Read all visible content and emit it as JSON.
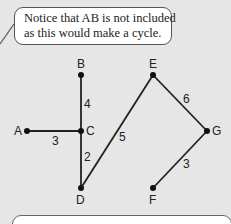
{
  "callout": {
    "lines": [
      "Notice that AB is not included",
      "as this would make a cycle."
    ]
  },
  "graph": {
    "vertices": {
      "A": {
        "label": "A",
        "x": 27,
        "y": 131
      },
      "B": {
        "label": "B",
        "x": 81,
        "y": 75
      },
      "C": {
        "label": "C",
        "x": 81,
        "y": 131
      },
      "D": {
        "label": "D",
        "x": 81,
        "y": 188
      },
      "E": {
        "label": "E",
        "x": 153,
        "y": 75
      },
      "F": {
        "label": "F",
        "x": 153,
        "y": 188
      },
      "G": {
        "label": "G",
        "x": 207,
        "y": 131
      }
    },
    "edges": [
      {
        "from": "A",
        "to": "C",
        "weight": "3"
      },
      {
        "from": "B",
        "to": "C",
        "weight": "4"
      },
      {
        "from": "C",
        "to": "D",
        "weight": "2"
      },
      {
        "from": "D",
        "to": "E",
        "weight": "5"
      },
      {
        "from": "E",
        "to": "G",
        "weight": "6"
      },
      {
        "from": "G",
        "to": "F",
        "weight": "3"
      }
    ]
  },
  "colors": {
    "background": "#e6e6e6",
    "line": "#222222"
  }
}
